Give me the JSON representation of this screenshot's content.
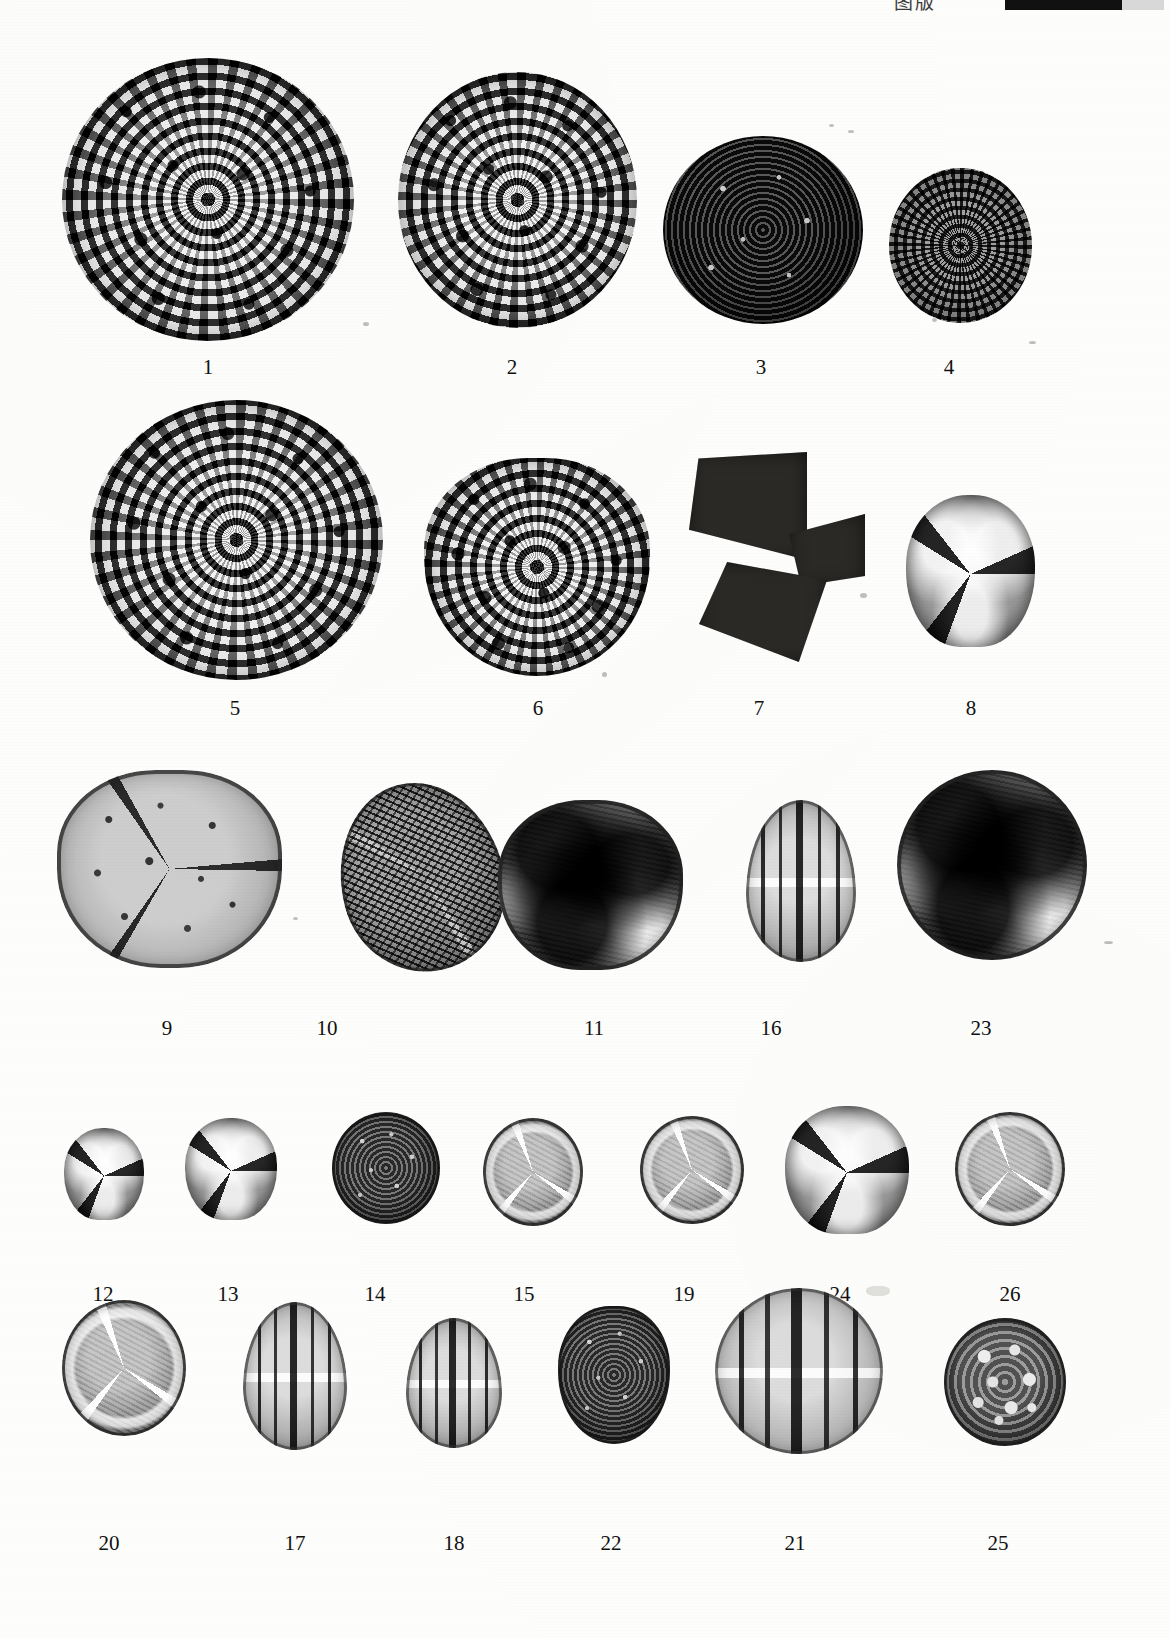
{
  "plate": {
    "caption_text": "图版",
    "scale_bar_name": "scale-bar",
    "background_color": "#fdfdfb",
    "ink_color": "#111111",
    "media_type": "light-micrograph-photographic-plate",
    "content": "palynological plate: pollen and spore light micrographs, numbered specimens",
    "specimen_count": 26
  },
  "rows": [
    {
      "row_index": 1,
      "specimens": [
        {
          "label": "1",
          "texture": "reticulate",
          "shape": "spheroidal",
          "description": "coarsely reticulate spheroidal grain, thick muri, large lumina"
        },
        {
          "label": "2",
          "texture": "reticulate",
          "shape": "spheroidal",
          "description": "reticulate-echinate spheroidal grain, radiating marginal sculpture"
        },
        {
          "label": "3",
          "texture": "echinate-dark",
          "shape": "spheroidal",
          "description": "dark densely echinate spheroidal grain with scattered pale puncta"
        },
        {
          "label": "4",
          "texture": "spiny",
          "shape": "spheroidal",
          "description": "small spinose spheroidal grain"
        }
      ]
    },
    {
      "row_index": 2,
      "specimens": [
        {
          "label": "5",
          "texture": "reticulate",
          "shape": "spheroidal",
          "description": "large coarsely reticulate grain, heavy muri, polygonal lumina"
        },
        {
          "label": "6",
          "texture": "reticulate",
          "shape": "subtriangular",
          "description": "reticulate subtriangular grain"
        },
        {
          "label": "7",
          "texture": "trilete-dark",
          "shape": "trilobate",
          "description": "opaque trilete spore, three dark lobes with pale laesurae"
        },
        {
          "label": "8",
          "texture": "trilete",
          "shape": "trilobate",
          "description": "trilete spore in proximal view, thick dark folds"
        }
      ]
    },
    {
      "row_index": 3,
      "specimens": [
        {
          "label": "9",
          "texture": "punctate-pale",
          "shape": "lobed-subcircular",
          "description": "pale thick-walled punctate lobed grain"
        },
        {
          "label": "10",
          "texture": "oval-reticulate",
          "shape": "oblique-oval",
          "description": "obliquely oriented reticulate grain with colpus folds"
        },
        {
          "label": "11",
          "texture": "mottled-lobed",
          "shape": "lobed-subcircular",
          "description": "mottled lobed grain with dark folds, polar view"
        },
        {
          "label": "16",
          "texture": "colpate",
          "shape": "prolate",
          "description": "striate-colpate prolate grain, equatorial view"
        },
        {
          "label": "23",
          "texture": "mottled-lobed",
          "shape": "subcircular",
          "description": "large dark mottled grain, thick exine, polar view"
        }
      ]
    },
    {
      "row_index": 4,
      "specimens": [
        {
          "label": "12",
          "texture": "trilete",
          "shape": "trilobate",
          "description": "small trilete spore, proximal view"
        },
        {
          "label": "13",
          "texture": "trilete",
          "shape": "trilobate",
          "description": "trilete spore with prominent pale laesurae"
        },
        {
          "label": "14",
          "texture": "granular-dark",
          "shape": "subcircular",
          "description": "dark granular subcircular grain"
        },
        {
          "label": "15",
          "texture": "arc-grain",
          "shape": "subcircular",
          "description": "subcircular grain with pale arcuate folds"
        },
        {
          "label": "19",
          "texture": "arc-grain",
          "shape": "subcircular",
          "description": "pale subcircular grain, bright arcuate thickenings"
        },
        {
          "label": "24",
          "texture": "trilete",
          "shape": "trilobate",
          "description": "granular trilete spore, dark lobes"
        },
        {
          "label": "26",
          "texture": "arc-grain",
          "shape": "subcircular",
          "description": "subcircular grain with pale folds, polar view"
        }
      ]
    },
    {
      "row_index": 5,
      "specimens": [
        {
          "label": "20",
          "texture": "arc-grain",
          "shape": "subcircular",
          "description": "dark grain with pale sinuous folds"
        },
        {
          "label": "17",
          "texture": "colpate",
          "shape": "prolate",
          "description": "pale tricolpate prolate grain, equatorial view"
        },
        {
          "label": "18",
          "texture": "colpate",
          "shape": "prolate",
          "description": "tricolpate prolate grain, distinct colpi"
        },
        {
          "label": "22",
          "texture": "granular-dark",
          "shape": "subcircular",
          "description": "dark granular grain, thick wall"
        },
        {
          "label": "21",
          "texture": "colpate",
          "shape": "broad-prolate",
          "description": "large pale striate grain with equatorial bands"
        },
        {
          "label": "25",
          "texture": "vesiculate",
          "shape": "subcircular",
          "description": "grain with large pale lumina / vesicles"
        }
      ]
    }
  ]
}
